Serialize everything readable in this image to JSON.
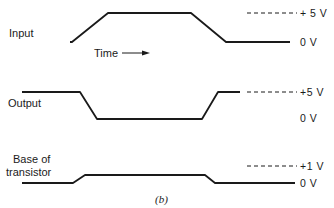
{
  "diagram": {
    "caption": "(b)",
    "time_label": "Time",
    "signals": [
      {
        "name": "Input",
        "label_lines": [
          "Input"
        ],
        "high_level": "+ 5 V",
        "low_level": "0 V",
        "shape": "pulse-high"
      },
      {
        "name": "Output",
        "label_lines": [
          "Output"
        ],
        "high_level": "+5 V",
        "low_level": "0 V",
        "shape": "pulse-low"
      },
      {
        "name": "Base of transistor",
        "label_lines": [
          "Base of",
          "transistor"
        ],
        "high_level": "+1 V",
        "low_level": "0 V",
        "shape": "pulse-high-small"
      }
    ]
  }
}
